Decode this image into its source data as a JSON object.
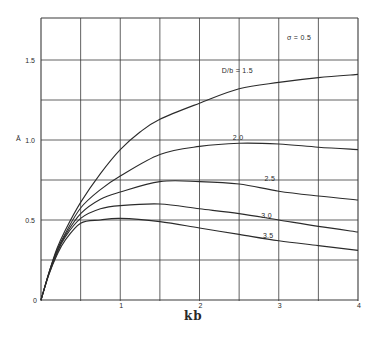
{
  "chart_data": {
    "type": "line",
    "title": "",
    "xlabel": "kb",
    "ylabel": "Ā",
    "xlim": [
      0,
      4
    ],
    "ylim": [
      0,
      1.75
    ],
    "grid": true,
    "x_grid_step": 0.5,
    "y_grid_step": 0.25,
    "x_ticks": [
      {
        "v": 0,
        "label": "0"
      },
      {
        "v": 1,
        "label": "1"
      },
      {
        "v": 2,
        "label": "2"
      },
      {
        "v": 3,
        "label": "3"
      },
      {
        "v": 4,
        "label": "4"
      }
    ],
    "y_ticks": [
      {
        "v": 0.5,
        "label": "0.5"
      },
      {
        "v": 1.0,
        "label": "1.0"
      },
      {
        "v": 1.5,
        "label": "1.5"
      }
    ],
    "annotations": [
      {
        "text": "σ = 0.5",
        "x": 3.1,
        "y": 1.64
      }
    ],
    "series": [
      {
        "name": "D/b = 1.5",
        "label": "D/b = 1.5",
        "label_pos": [
          2.28,
          1.42
        ],
        "x": [
          0,
          0.1,
          0.2,
          0.3,
          0.5,
          0.75,
          1.0,
          1.25,
          1.5,
          2.0,
          2.5,
          3.0,
          3.5,
          4.0
        ],
        "values": [
          0,
          0.17,
          0.32,
          0.43,
          0.61,
          0.79,
          0.94,
          1.05,
          1.13,
          1.23,
          1.32,
          1.36,
          1.39,
          1.41
        ]
      },
      {
        "name": "D/b = 2.0",
        "label": "2.0",
        "label_pos": [
          2.42,
          1.0
        ],
        "x": [
          0,
          0.1,
          0.2,
          0.3,
          0.5,
          0.75,
          1.0,
          1.5,
          2.0,
          2.5,
          3.0,
          3.5,
          4.0
        ],
        "values": [
          0,
          0.17,
          0.31,
          0.41,
          0.575,
          0.69,
          0.775,
          0.91,
          0.96,
          0.98,
          0.975,
          0.955,
          0.94
        ]
      },
      {
        "name": "D/b = 2.5",
        "label": "2.5",
        "label_pos": [
          2.82,
          0.745
        ],
        "x": [
          0,
          0.1,
          0.2,
          0.3,
          0.5,
          0.75,
          1.0,
          1.5,
          2.0,
          2.5,
          3.0,
          3.5,
          4.0
        ],
        "values": [
          0,
          0.17,
          0.3,
          0.4,
          0.54,
          0.63,
          0.675,
          0.74,
          0.74,
          0.725,
          0.68,
          0.65,
          0.625
        ]
      },
      {
        "name": "D/b = 3.0",
        "label": "3.0",
        "label_pos": [
          2.78,
          0.515
        ],
        "x": [
          0,
          0.1,
          0.2,
          0.3,
          0.5,
          0.75,
          1.0,
          1.5,
          2.0,
          2.5,
          3.0,
          3.5,
          4.0
        ],
        "values": [
          0,
          0.16,
          0.29,
          0.39,
          0.51,
          0.57,
          0.59,
          0.6,
          0.57,
          0.54,
          0.5,
          0.46,
          0.425
        ]
      },
      {
        "name": "D/b = 3.5",
        "label": "3.5",
        "label_pos": [
          2.8,
          0.385
        ],
        "x": [
          0,
          0.1,
          0.2,
          0.3,
          0.5,
          0.75,
          1.0,
          1.5,
          2.0,
          2.5,
          3.0,
          3.5,
          4.0
        ],
        "values": [
          0,
          0.16,
          0.28,
          0.37,
          0.48,
          0.5,
          0.51,
          0.49,
          0.45,
          0.41,
          0.37,
          0.34,
          0.31
        ]
      }
    ]
  },
  "colors": {
    "line": "#2b2b2b",
    "grid": "#3a3a3a",
    "background": "#ffffff"
  },
  "layout": {
    "x0": 41,
    "x_per_unit": 79.25,
    "y0": 300,
    "y_per_unit": 160
  }
}
